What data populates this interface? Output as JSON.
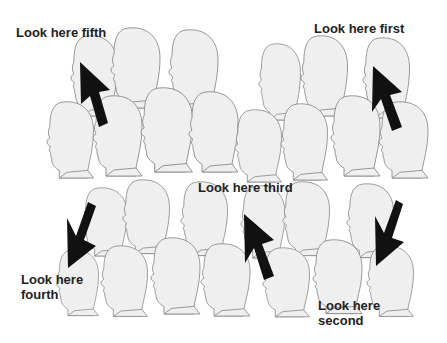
{
  "figure": {
    "head_fill": "#efefef",
    "head_stroke": "#8a8a8a",
    "arrow_color": "#111111"
  },
  "labels": {
    "first": "Look here first",
    "second_line1": "Look here",
    "second_line2": "second",
    "third": "Look here third",
    "fourth_line1": "Look here",
    "fourth_line2": "fourth",
    "fifth": "Look here fifth"
  }
}
